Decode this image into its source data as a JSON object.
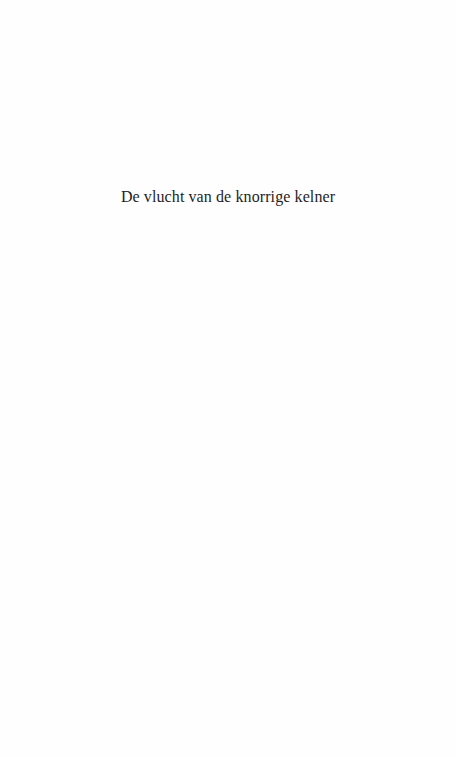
{
  "page": {
    "title": "De vlucht van de knorrige kelner"
  }
}
